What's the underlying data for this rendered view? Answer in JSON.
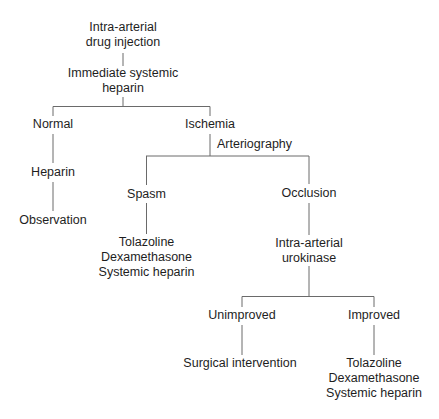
{
  "diagram": {
    "type": "flowchart-tree",
    "nodes": {
      "root": {
        "lines": [
          "Intra-arterial",
          "drug injection"
        ]
      },
      "heparin_immediate": {
        "lines": [
          "Immediate systemic",
          "heparin"
        ]
      },
      "normal": {
        "lines": [
          "Normal"
        ]
      },
      "normal_heparin": {
        "lines": [
          "Heparin"
        ]
      },
      "observation": {
        "lines": [
          "Observation"
        ]
      },
      "ischemia": {
        "lines": [
          "Ischemia"
        ]
      },
      "arteriography": {
        "lines": [
          "Arteriography"
        ]
      },
      "spasm": {
        "lines": [
          "Spasm"
        ]
      },
      "spasm_treatment": {
        "lines": [
          "Tolazoline",
          "Dexamethasone",
          "Systemic heparin"
        ]
      },
      "occlusion": {
        "lines": [
          "Occlusion"
        ]
      },
      "urokinase": {
        "lines": [
          "Intra-arterial",
          "urokinase"
        ]
      },
      "unimproved": {
        "lines": [
          "Unimproved"
        ]
      },
      "surgical": {
        "lines": [
          "Surgical intervention"
        ]
      },
      "improved": {
        "lines": [
          "Improved"
        ]
      },
      "improved_treatment": {
        "lines": [
          "Tolazoline",
          "Dexamethasone",
          "Systemic heparin"
        ]
      }
    },
    "edges": [
      [
        "root",
        "heparin_immediate"
      ],
      [
        "heparin_immediate",
        "normal"
      ],
      [
        "heparin_immediate",
        "ischemia"
      ],
      [
        "normal",
        "normal_heparin"
      ],
      [
        "normal_heparin",
        "observation"
      ],
      [
        "ischemia",
        "spasm"
      ],
      [
        "ischemia",
        "occlusion"
      ],
      [
        "spasm",
        "spasm_treatment"
      ],
      [
        "occlusion",
        "urokinase"
      ],
      [
        "urokinase",
        "unimproved"
      ],
      [
        "urokinase",
        "improved"
      ],
      [
        "unimproved",
        "surgical"
      ],
      [
        "improved",
        "improved_treatment"
      ]
    ],
    "edge_labels": [
      {
        "edge": [
          "ischemia",
          "spasm/occlusion"
        ],
        "label": "Arteriography"
      }
    ],
    "colors": {
      "text": "#1e1e1e",
      "lines": "#6a6a6a",
      "background": "#ffffff"
    }
  }
}
